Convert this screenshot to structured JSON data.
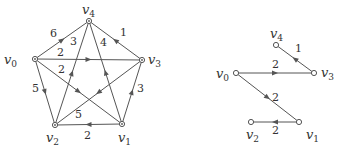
{
  "graphs": [
    {
      "name": "full-graph",
      "nodes": [
        {
          "id": "v0",
          "label": "v",
          "sub": "0",
          "x": 35,
          "y": 59,
          "lx": 4,
          "ly": 64
        },
        {
          "id": "v1",
          "label": "v",
          "sub": "1",
          "x": 122,
          "y": 124,
          "lx": 118,
          "ly": 142
        },
        {
          "id": "v2",
          "label": "v",
          "sub": "2",
          "x": 55,
          "y": 125,
          "lx": 46,
          "ly": 142
        },
        {
          "id": "v3",
          "label": "v",
          "sub": "3",
          "x": 142,
          "y": 60,
          "lx": 148,
          "ly": 64
        },
        {
          "id": "v4",
          "label": "v",
          "sub": "4",
          "x": 89,
          "y": 21,
          "lx": 82,
          "ly": 14
        }
      ],
      "edges": [
        {
          "from": "v0",
          "to": "v4",
          "weight": "6",
          "wx": 50,
          "wy": 37
        },
        {
          "from": "v0",
          "to": "v3",
          "weight": "2",
          "wx": 57,
          "wy": 56
        },
        {
          "from": "v0",
          "to": "v1",
          "weight": "2",
          "wx": 58,
          "wy": 73
        },
        {
          "from": "v0",
          "to": "v2",
          "weight": "5",
          "wx": 32,
          "wy": 92
        },
        {
          "from": "v2",
          "to": "v4",
          "weight": "3",
          "wx": 70,
          "wy": 45
        },
        {
          "from": "v1",
          "to": "v4",
          "weight": "4",
          "wx": 100,
          "wy": 46
        },
        {
          "from": "v3",
          "to": "v4",
          "weight": "1",
          "wx": 120,
          "wy": 36
        },
        {
          "from": "v1",
          "to": "v3",
          "weight": "3",
          "wx": 137,
          "wy": 92
        },
        {
          "from": "v3",
          "to": "v2",
          "weight": "5",
          "wx": 75,
          "wy": 118
        },
        {
          "from": "v1",
          "to": "v2",
          "weight": "2",
          "wx": 84,
          "wy": 139
        }
      ]
    },
    {
      "name": "shortest-path-tree",
      "nodes": [
        {
          "id": "v0",
          "label": "v",
          "sub": "0",
          "x": 236,
          "y": 73,
          "lx": 216,
          "ly": 78
        },
        {
          "id": "v1",
          "label": "v",
          "sub": "1",
          "x": 299,
          "y": 122,
          "lx": 306,
          "ly": 139
        },
        {
          "id": "v2",
          "label": "v",
          "sub": "2",
          "x": 251,
          "y": 122,
          "lx": 246,
          "ly": 139
        },
        {
          "id": "v3",
          "label": "v",
          "sub": "3",
          "x": 314,
          "y": 73,
          "lx": 321,
          "ly": 77
        },
        {
          "id": "v4",
          "label": "v",
          "sub": "4",
          "x": 276,
          "y": 45,
          "lx": 270,
          "ly": 38
        }
      ],
      "edges": [
        {
          "from": "v0",
          "to": "v3",
          "weight": "2",
          "wx": 272,
          "wy": 68
        },
        {
          "from": "v3",
          "to": "v4",
          "weight": "1",
          "wx": 295,
          "wy": 52
        },
        {
          "from": "v0",
          "to": "v1",
          "weight": "2",
          "wx": 272,
          "wy": 101
        },
        {
          "from": "v1",
          "to": "v2",
          "weight": "2",
          "wx": 272,
          "wy": 134
        }
      ]
    }
  ]
}
